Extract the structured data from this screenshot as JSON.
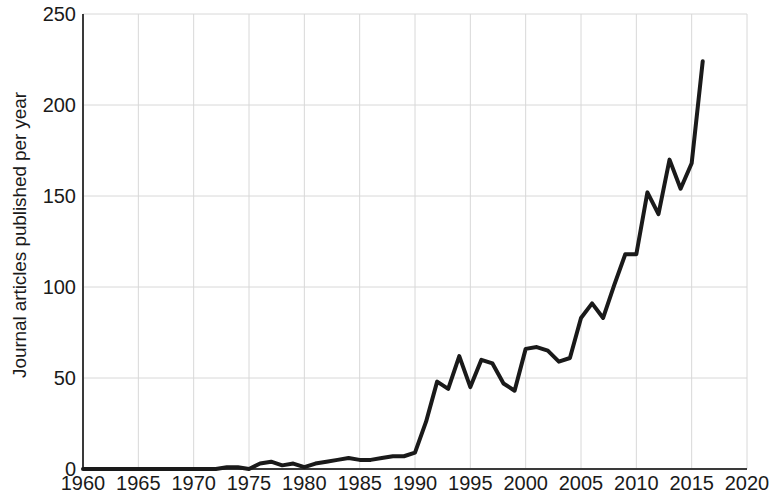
{
  "chart_data": {
    "type": "line",
    "title": "",
    "subtitle": "",
    "xlabel": "",
    "ylabel": "Journal articles published per year",
    "xlim": [
      1960,
      2020
    ],
    "ylim": [
      0,
      250
    ],
    "grid": true,
    "legend": null,
    "x_ticks": [
      1960,
      1965,
      1970,
      1975,
      1980,
      1985,
      1990,
      1995,
      2000,
      2005,
      2010,
      2015,
      2020
    ],
    "y_ticks": [
      0,
      50,
      100,
      150,
      200,
      250
    ],
    "line_color": "#1a1a1a",
    "line_width": 4,
    "grid_color": "#d8d8d8",
    "axis_color": "#3a3a3a",
    "series": [
      {
        "name": "Journal articles published per year",
        "x": [
          1960,
          1961,
          1962,
          1963,
          1964,
          1965,
          1966,
          1967,
          1968,
          1969,
          1970,
          1971,
          1972,
          1973,
          1974,
          1975,
          1976,
          1977,
          1978,
          1979,
          1980,
          1981,
          1982,
          1983,
          1984,
          1985,
          1986,
          1987,
          1988,
          1989,
          1990,
          1991,
          1992,
          1993,
          1994,
          1995,
          1996,
          1997,
          1998,
          1999,
          2000,
          2001,
          2002,
          2003,
          2004,
          2005,
          2006,
          2007,
          2008,
          2009,
          2010,
          2011,
          2012,
          2013,
          2014,
          2015,
          2016
        ],
        "values": [
          0,
          0,
          0,
          0,
          0,
          0,
          0,
          0,
          0,
          0,
          0,
          0,
          0,
          1,
          1,
          0,
          3,
          4,
          2,
          3,
          1,
          3,
          4,
          5,
          6,
          5,
          5,
          6,
          7,
          7,
          9,
          26,
          48,
          44,
          62,
          45,
          60,
          58,
          47,
          43,
          66,
          67,
          65,
          59,
          61,
          83,
          91,
          83,
          101,
          118,
          118,
          152,
          140,
          170,
          154,
          168,
          224
        ]
      }
    ]
  }
}
